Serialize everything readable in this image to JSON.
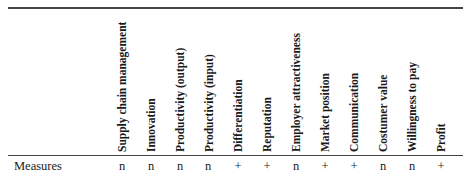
{
  "table": {
    "columns": [
      "Supply chain management",
      "Innovation",
      "Productivity (output)",
      "Productivity (input)",
      "Differentiation",
      "Reputation",
      "Employer attractiveness",
      "Market position",
      "Communication",
      "Costumer value",
      "Willingness to pay",
      "Profit"
    ],
    "rows": [
      {
        "label": "Measures",
        "values": [
          "n",
          "n",
          "n",
          "n",
          "+",
          "+",
          "n",
          "+",
          "+",
          "n",
          "n",
          "+"
        ]
      }
    ]
  }
}
